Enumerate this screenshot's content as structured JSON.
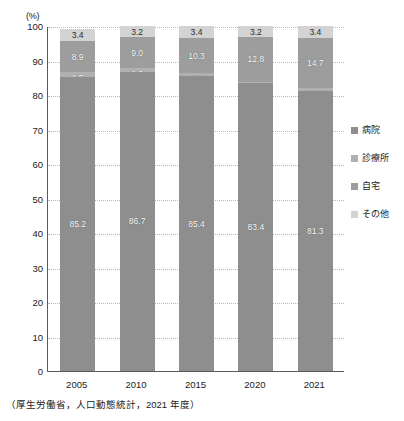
{
  "chart_data": {
    "type": "bar",
    "subtype": "stacked-100",
    "title": "",
    "xlabel": "",
    "ylabel": "",
    "yunit": "(%)",
    "ylim": [
      0,
      100
    ],
    "yticks": [
      100,
      90,
      80,
      70,
      60,
      50,
      40,
      30,
      20,
      10,
      0
    ],
    "grid": true,
    "legend_position": "right",
    "categories": [
      "2005",
      "2010",
      "2015",
      "2020",
      "2021"
    ],
    "series": [
      {
        "name": "病院",
        "key": "hospital",
        "color": "#8e8e8e",
        "values": [
          85.2,
          86.7,
          85.4,
          83.4,
          81.3
        ]
      },
      {
        "name": "診療所",
        "key": "clinic",
        "color": "#b0b0b0",
        "values": [
          1.5,
          1.0,
          0.9,
          0.5,
          0.6
        ]
      },
      {
        "name": "自宅",
        "key": "home",
        "color": "#9d9d9d",
        "values": [
          8.9,
          9.0,
          10.3,
          12.8,
          14.7
        ]
      },
      {
        "name": "その他",
        "key": "other",
        "color": "#d3d3d3",
        "values": [
          3.4,
          3.2,
          3.4,
          3.2,
          3.4
        ]
      }
    ],
    "source": "（厚生労働省，人口動態統計，2021 年度）"
  },
  "legend": {
    "items": [
      {
        "label": "病院"
      },
      {
        "label": "診療所"
      },
      {
        "label": "自宅"
      },
      {
        "label": "その他"
      }
    ]
  }
}
